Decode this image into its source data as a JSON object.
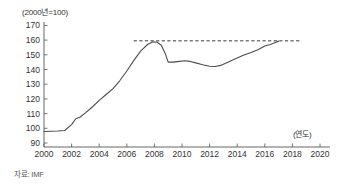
{
  "notes": {
    "unit_label": "(2000년=100)",
    "axis_unit_label": "(연도)",
    "source_label": "자료: IMF"
  },
  "chart_data": {
    "type": "line",
    "title": "",
    "subtitle": "",
    "xlabel": "(연도)",
    "ylabel": "(2000년=100)",
    "xlim": [
      2000,
      2020
    ],
    "ylim": [
      90,
      170
    ],
    "grid": false,
    "legend": null,
    "line_color": "#4d4d4d",
    "reference_line_color": "#3a3a3a",
    "x_ticks": [
      2000,
      2002,
      2004,
      2006,
      2008,
      2010,
      2012,
      2014,
      2016,
      2018,
      2020
    ],
    "x_tick_labels": [
      "2000",
      "2002",
      "2004",
      "2006",
      "2008",
      "2010",
      "2012",
      "2014",
      "2016",
      "2018",
      "2020"
    ],
    "y_ticks": [
      90,
      100,
      110,
      120,
      130,
      140,
      150,
      160,
      170
    ],
    "y_tick_labels": [
      "90",
      "100",
      "110",
      "120",
      "130",
      "140",
      "150",
      "160",
      "170"
    ],
    "series": [
      {
        "name": "index",
        "x": [
          2000.0,
          2000.5,
          2001.0,
          2001.5,
          2002.0,
          2002.3,
          2002.6,
          2003.0,
          2003.5,
          2004.0,
          2004.5,
          2005.0,
          2005.5,
          2006.0,
          2006.5,
          2007.0,
          2007.5,
          2007.9,
          2008.2,
          2008.5,
          2008.8,
          2009.0,
          2009.4,
          2009.8,
          2010.2,
          2010.6,
          2011.0,
          2011.5,
          2012.0,
          2012.4,
          2012.8,
          2013.2,
          2013.8,
          2014.4,
          2015.0,
          2015.5,
          2016.0,
          2016.4,
          2016.8,
          2017.0
        ],
        "values": [
          97.8,
          98.0,
          98.2,
          98.5,
          102.5,
          106.5,
          107.5,
          110.5,
          114.5,
          119.0,
          123.0,
          127.0,
          132.5,
          139.0,
          146.0,
          152.5,
          157.0,
          158.8,
          158.5,
          156.5,
          150.5,
          145.0,
          145.0,
          145.5,
          146.0,
          145.5,
          144.5,
          143.2,
          142.2,
          142.0,
          142.8,
          144.5,
          147.0,
          149.5,
          151.5,
          153.5,
          156.0,
          157.0,
          158.5,
          159.3
        ]
      }
    ],
    "reference_line": {
      "label": "",
      "y": 159.5,
      "x_start": 2006.5,
      "x_end": 2018.6,
      "style": "dashed"
    },
    "annotations": [
      {
        "text": "(2000년=100)",
        "position": "top-left"
      },
      {
        "text": "(연도)",
        "position": "bottom-right"
      },
      {
        "text": "자료: IMF",
        "position": "below-axis-left"
      }
    ]
  }
}
